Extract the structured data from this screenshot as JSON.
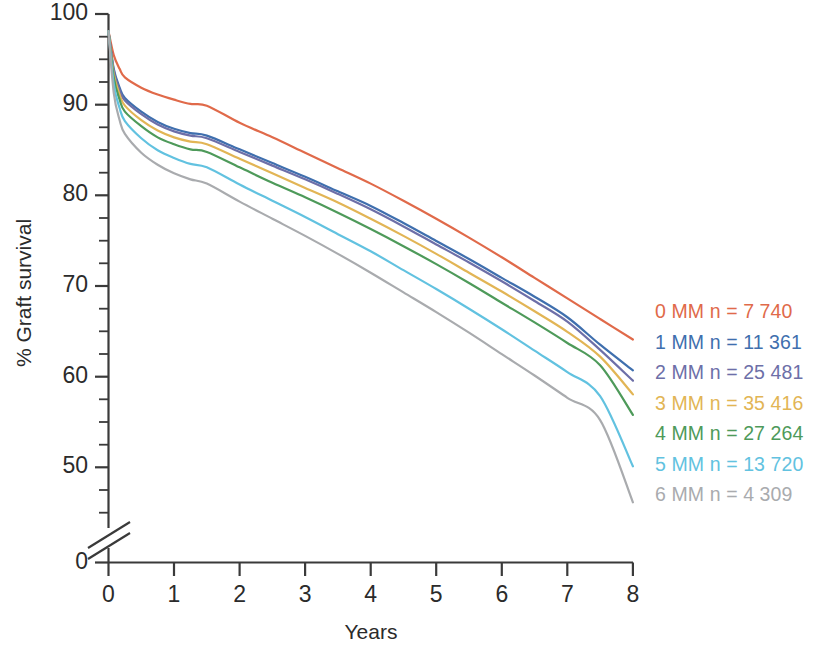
{
  "chart_data": {
    "type": "line",
    "title": "",
    "xlabel": "Years",
    "ylabel": "% Graft survival",
    "xlim": [
      0,
      8
    ],
    "ylim": [
      40,
      100
    ],
    "y_axis_break": true,
    "y_axis_break_note": "axis broken between 40 and 0",
    "grid": false,
    "legend_position": "right",
    "xticks": [
      "0",
      "1",
      "2",
      "3",
      "4",
      "5",
      "6",
      "7",
      "8"
    ],
    "yticks_major": [
      "100",
      "90",
      "80",
      "70",
      "60",
      "50",
      "0"
    ],
    "ytick_minor_step": 2.5,
    "x": [
      0,
      0.08,
      0.17,
      0.25,
      0.5,
      0.75,
      1,
      1.25,
      1.5,
      2,
      2.5,
      3,
      3.5,
      4,
      4.5,
      5,
      5.5,
      6,
      6.5,
      7,
      7.5,
      8
    ],
    "series": [
      {
        "name": "0 MM",
        "label": "0 MM n = 7 740",
        "color": "#e06a4a",
        "n": "7 740",
        "values": [
          98.0,
          95.2,
          93.6,
          92.6,
          91.4,
          90.6,
          90.0,
          89.5,
          89.3,
          87.3,
          85.6,
          83.8,
          82.0,
          80.2,
          78.2,
          76.1,
          73.9,
          71.6,
          69.2,
          66.8,
          64.4,
          62.0
        ]
      },
      {
        "name": "1 MM",
        "label": "1 MM n = 11 361",
        "color": "#3f6fae",
        "n": "11 361",
        "values": [
          98.0,
          93.6,
          91.4,
          90.2,
          88.6,
          87.4,
          86.6,
          86.1,
          85.8,
          84.2,
          82.6,
          81.0,
          79.3,
          77.6,
          75.6,
          73.5,
          71.4,
          69.2,
          67.0,
          64.6,
          61.4,
          58.4
        ]
      },
      {
        "name": "2 MM",
        "label": "2 MM n = 25 481",
        "color": "#6d6fa8",
        "n": "25 481",
        "values": [
          98.0,
          93.4,
          91.1,
          89.9,
          88.3,
          87.1,
          86.3,
          85.8,
          85.5,
          83.9,
          82.3,
          80.7,
          79.0,
          77.2,
          75.2,
          73.1,
          71.0,
          68.8,
          66.5,
          64.1,
          60.8,
          57.2
        ]
      },
      {
        "name": "3 MM",
        "label": "3 MM n = 35 416",
        "color": "#e2b555",
        "n": "35 416",
        "values": [
          98.0,
          93.0,
          90.6,
          89.3,
          87.6,
          86.4,
          85.6,
          85.1,
          84.8,
          83.1,
          81.4,
          79.7,
          78.0,
          76.1,
          74.1,
          72.0,
          69.8,
          67.6,
          65.3,
          62.9,
          60.0,
          55.6
        ]
      },
      {
        "name": "4 MM",
        "label": "4 MM n = 27 264",
        "color": "#4e9a5a",
        "n": "27 264",
        "values": [
          98.0,
          92.6,
          90.0,
          88.6,
          86.9,
          85.6,
          84.8,
          84.2,
          83.9,
          82.1,
          80.3,
          78.6,
          76.8,
          74.9,
          72.9,
          70.8,
          68.6,
          66.3,
          64.0,
          61.6,
          59.0,
          53.2
        ]
      },
      {
        "name": "5 MM",
        "label": "5 MM n = 13 720",
        "color": "#62c2e0",
        "n": "13 720",
        "values": [
          98.0,
          91.8,
          89.0,
          87.5,
          85.5,
          84.1,
          83.2,
          82.5,
          82.1,
          80.1,
          78.2,
          76.3,
          74.3,
          72.3,
          70.1,
          67.9,
          65.6,
          63.2,
          60.7,
          58.2,
          55.4,
          47.2
        ]
      },
      {
        "name": "6 MM",
        "label": "6 MM n = 4 309",
        "color": "#a9abae",
        "n": "4 309",
        "values": [
          98.0,
          90.8,
          87.6,
          86.0,
          83.8,
          82.4,
          81.4,
          80.7,
          80.2,
          78.1,
          76.1,
          74.1,
          72.0,
          69.8,
          67.5,
          65.2,
          62.8,
          60.3,
          57.8,
          55.2,
          52.6,
          43.0
        ]
      }
    ]
  },
  "axes": {
    "ylabel": "% Graft survival",
    "xlabel": "Years",
    "ytick_labels": [
      "100",
      "90",
      "80",
      "70",
      "60",
      "50",
      "0"
    ],
    "xtick_labels": [
      "0",
      "1",
      "2",
      "3",
      "4",
      "5",
      "6",
      "7",
      "8"
    ]
  },
  "legend": {
    "items": [
      {
        "label": "0 MM n = 7 740",
        "color": "#e06a4a"
      },
      {
        "label": "1 MM n = 11 361",
        "color": "#3f6fae"
      },
      {
        "label": "2 MM n = 25 481",
        "color": "#6d6fa8"
      },
      {
        "label": "3 MM n = 35 416",
        "color": "#e2b555"
      },
      {
        "label": "4 MM n = 27 264",
        "color": "#4e9a5a"
      },
      {
        "label": "5 MM n = 13 720",
        "color": "#62c2e0"
      },
      {
        "label": "6 MM n = 4 309",
        "color": "#a9abae"
      }
    ]
  }
}
